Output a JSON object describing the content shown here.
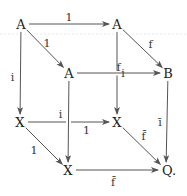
{
  "diagram": {
    "type": "commutative-cube",
    "nodes": [
      {
        "id": "A_tl",
        "label": "A"
      },
      {
        "id": "A_tr",
        "label": "A"
      },
      {
        "id": "A_mid",
        "label": "A"
      },
      {
        "id": "B",
        "label": "B"
      },
      {
        "id": "X_l",
        "label": "X"
      },
      {
        "id": "X_mid",
        "label": "X"
      },
      {
        "id": "X_bot",
        "label": "X"
      },
      {
        "id": "Q",
        "label": "Q."
      }
    ],
    "edges": [
      {
        "from": "A_tl",
        "to": "A_tr",
        "label": "1"
      },
      {
        "from": "A_tl",
        "to": "A_mid",
        "label": "1"
      },
      {
        "from": "A_tr",
        "to": "B",
        "label": "f"
      },
      {
        "from": "A_mid",
        "to": "B",
        "label": "f"
      },
      {
        "from": "A_tl",
        "to": "X_l",
        "label": "i"
      },
      {
        "from": "A_mid",
        "to": "X_bot",
        "label": "i"
      },
      {
        "from": "A_tr",
        "to": "X_mid",
        "label": "i"
      },
      {
        "from": "B",
        "to": "Q",
        "label": "ī"
      },
      {
        "from": "X_l",
        "to": "X_mid",
        "label": "1"
      },
      {
        "from": "X_l",
        "to": "X_bot",
        "label": "1"
      },
      {
        "from": "X_mid",
        "to": "Q",
        "label": "f̄"
      },
      {
        "from": "X_bot",
        "to": "Q",
        "label": "f̄"
      }
    ]
  }
}
